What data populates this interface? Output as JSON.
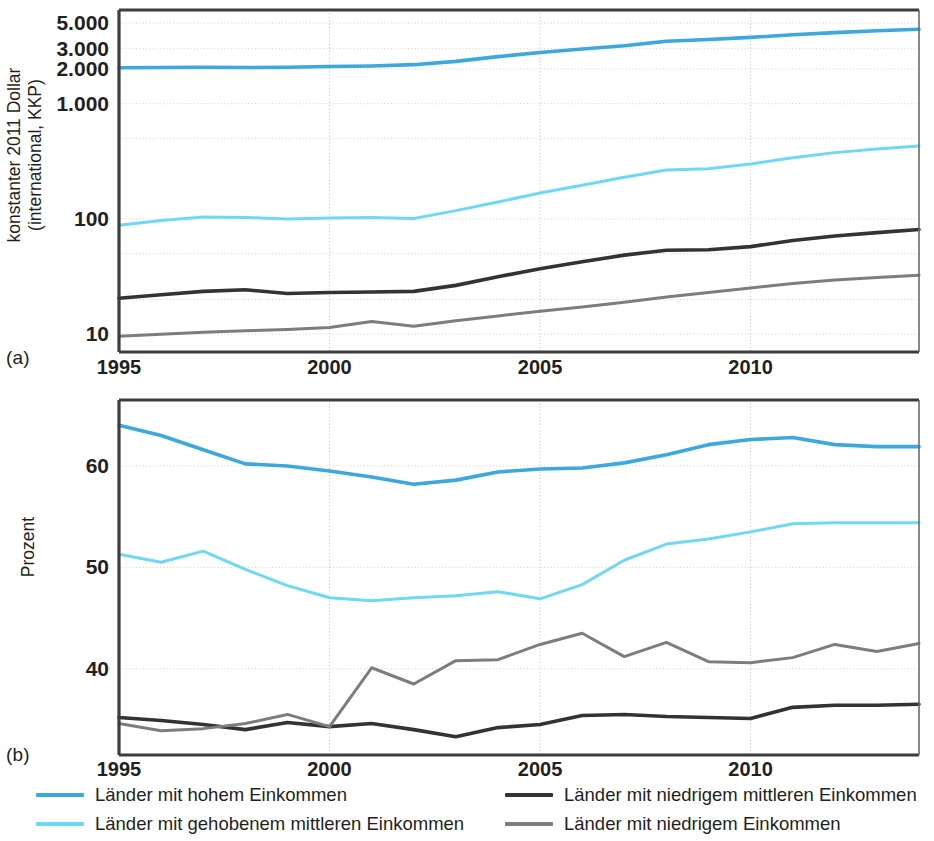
{
  "figure": {
    "width": 934,
    "height": 841,
    "background": "#ffffff"
  },
  "panels": [
    {
      "tag": "(a)",
      "ylabel": "konstanter 2011 Dollar\n(international, KKP)"
    },
    {
      "tag": "(b)",
      "ylabel": "Prozent"
    }
  ],
  "series_colors": {
    "high_income": "#3BA8DE",
    "upper_middle_income": "#6FD8F2",
    "lower_middle_income": "#333333",
    "low_income": "#7D7D7D"
  },
  "legend": {
    "position": "below",
    "items": [
      {
        "label": "Länder mit hohem Einkommen",
        "color": "#3BA8DE",
        "key": "high_income"
      },
      {
        "label": "Länder mit gehobenem mittleren Einkommen",
        "color": "#6FD8F2",
        "key": "upper_middle_income"
      },
      {
        "label": "Länder mit niedrigem mittleren Einkommen",
        "color": "#333333",
        "key": "lower_middle_income"
      },
      {
        "label": "Länder mit niedrigem Einkommen",
        "color": "#7D7D7D",
        "key": "low_income"
      }
    ]
  },
  "chart_data": [
    {
      "type": "line",
      "panel": "(a)",
      "title": "",
      "xlabel": "",
      "ylabel": "konstanter 2011 Dollar (international, KKP)",
      "yscale": "log",
      "ylim": [
        7,
        6500
      ],
      "xlim": [
        1995,
        2014
      ],
      "grid": true,
      "ytick_labels": [
        "5.000",
        "3.000",
        "2.000",
        "1.000",
        "100",
        "10"
      ],
      "ytick_values": [
        5000,
        3000,
        2000,
        1000,
        100,
        10
      ],
      "xtick_labels": [
        "1995",
        "2000",
        "2005",
        "2010"
      ],
      "xtick_values": [
        1995,
        2000,
        2005,
        2010
      ],
      "x": [
        1995,
        1996,
        1997,
        1998,
        1999,
        2000,
        2001,
        2002,
        2003,
        2004,
        2005,
        2006,
        2007,
        2008,
        2009,
        2010,
        2011,
        2012,
        2013,
        2014
      ],
      "series": [
        {
          "name": "Länder mit hohem Einkommen",
          "color": "#3BA8DE",
          "values": [
            2050,
            2060,
            2070,
            2060,
            2070,
            2100,
            2120,
            2180,
            2330,
            2560,
            2780,
            2980,
            3180,
            3480,
            3600,
            3760,
            3960,
            4140,
            4300,
            4420
          ]
        },
        {
          "name": "Länder mit gehobenem mittleren Einkommen",
          "color": "#6FD8F2",
          "values": [
            88,
            97,
            104,
            103,
            100,
            102,
            103,
            101,
            118,
            140,
            168,
            196,
            230,
            266,
            272,
            300,
            340,
            376,
            404,
            430
          ]
        },
        {
          "name": "Länder mit niedrigem mittleren Einkommen",
          "color": "#333333",
          "values": [
            20.5,
            22.0,
            23.5,
            24.3,
            22.5,
            23.0,
            23.2,
            23.5,
            26.5,
            31.5,
            37.0,
            42.5,
            48.5,
            53.5,
            54.0,
            57.5,
            65.0,
            71.0,
            76.0,
            81.0
          ]
        },
        {
          "name": "Länder mit niedrigem Einkommen",
          "color": "#7D7D7D",
          "values": [
            9.6,
            10.0,
            10.4,
            10.7,
            11.0,
            11.4,
            12.9,
            11.7,
            13.1,
            14.4,
            15.8,
            17.2,
            18.9,
            21.0,
            23.0,
            25.2,
            27.5,
            29.5,
            31.0,
            32.5
          ]
        }
      ]
    },
    {
      "type": "line",
      "panel": "(b)",
      "title": "",
      "xlabel": "",
      "ylabel": "Prozent",
      "yscale": "linear",
      "ylim": [
        31.5,
        66.5
      ],
      "xlim": [
        1995,
        2014
      ],
      "grid": true,
      "ytick_labels": [
        "60",
        "50",
        "40"
      ],
      "ytick_values": [
        60,
        50,
        40
      ],
      "xtick_labels": [
        "1995",
        "2000",
        "2005",
        "2010"
      ],
      "xtick_values": [
        1995,
        2000,
        2005,
        2010
      ],
      "x": [
        1995,
        1996,
        1997,
        1998,
        1999,
        2000,
        2001,
        2002,
        2003,
        2004,
        2005,
        2006,
        2007,
        2008,
        2009,
        2010,
        2011,
        2012,
        2013,
        2014
      ],
      "series": [
        {
          "name": "Länder mit hohem Einkommen",
          "color": "#3BA8DE",
          "values": [
            64.0,
            63.0,
            61.6,
            60.2,
            60.0,
            59.5,
            58.9,
            58.2,
            58.6,
            59.4,
            59.7,
            59.8,
            60.3,
            61.1,
            62.1,
            62.6,
            62.8,
            62.1,
            61.9,
            61.9
          ]
        },
        {
          "name": "Länder mit gehobenem mittleren Einkommen",
          "color": "#6FD8F2",
          "values": [
            51.3,
            50.5,
            51.6,
            49.8,
            48.2,
            47.0,
            46.7,
            47.0,
            47.2,
            47.6,
            46.9,
            48.3,
            50.7,
            52.3,
            52.8,
            53.5,
            54.3,
            54.4,
            54.4,
            54.4
          ]
        },
        {
          "name": "Länder mit niedrigem mittleren Einkommen",
          "color": "#333333",
          "values": [
            35.2,
            34.9,
            34.5,
            34.0,
            34.7,
            34.3,
            34.6,
            34.0,
            33.3,
            34.2,
            34.5,
            35.4,
            35.5,
            35.3,
            35.2,
            35.1,
            36.2,
            36.4,
            36.4,
            36.5
          ]
        },
        {
          "name": "Länder mit niedrigem Einkommen",
          "color": "#7D7D7D",
          "values": [
            34.6,
            33.9,
            34.1,
            34.6,
            35.5,
            34.3,
            40.1,
            38.5,
            40.8,
            40.9,
            42.4,
            43.5,
            41.2,
            42.6,
            40.7,
            40.6,
            41.1,
            42.4,
            41.7,
            42.5
          ]
        }
      ]
    }
  ]
}
